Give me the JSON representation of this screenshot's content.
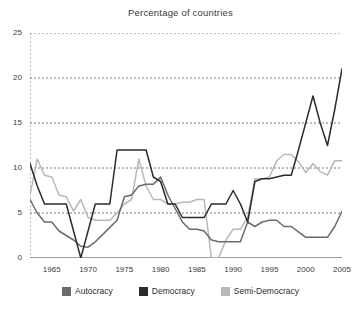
{
  "chart_data": {
    "type": "line",
    "title": "Percentage of countries",
    "xlabel": "",
    "ylabel": "",
    "xlim": [
      1962,
      2005
    ],
    "ylim": [
      0,
      25
    ],
    "grid": true,
    "grid_style": "dotted horizontal",
    "legend_position": "bottom",
    "y_ticks": [
      0,
      5,
      10,
      15,
      20,
      25
    ],
    "x_ticks": [
      1965,
      1970,
      1975,
      1980,
      1985,
      1990,
      1995,
      2000,
      2005
    ],
    "x_minor_tick_interval": 1,
    "x": [
      1962,
      1963,
      1964,
      1965,
      1966,
      1967,
      1968,
      1969,
      1970,
      1971,
      1972,
      1973,
      1974,
      1975,
      1976,
      1977,
      1978,
      1979,
      1980,
      1981,
      1982,
      1983,
      1984,
      1985,
      1986,
      1987,
      1988,
      1989,
      1990,
      1991,
      1992,
      1993,
      1994,
      1995,
      1996,
      1997,
      1998,
      1999,
      2000,
      2001,
      2002,
      2003,
      2004,
      2005
    ],
    "series": [
      {
        "name": "Autocracy",
        "color": "#6b6b6b",
        "values": [
          6.5,
          5.0,
          4.0,
          4.0,
          3.0,
          2.5,
          2.0,
          1.3,
          1.2,
          1.8,
          2.6,
          3.4,
          4.2,
          6.8,
          7.0,
          8.0,
          8.2,
          8.2,
          9.0,
          7.0,
          5.5,
          4.0,
          3.2,
          3.2,
          3.0,
          2.0,
          1.8,
          1.8,
          1.8,
          1.8,
          4.0,
          3.5,
          4.0,
          4.2,
          4.2,
          3.5,
          3.5,
          2.9,
          2.3,
          2.3,
          2.3,
          2.3,
          3.5,
          5.2
        ]
      },
      {
        "name": "Democracy",
        "color": "#2b2b2b",
        "values": [
          10.5,
          8.0,
          6.0,
          6.0,
          6.0,
          6.0,
          3.0,
          0.0,
          3.0,
          6.0,
          6.0,
          6.0,
          12.0,
          12.0,
          12.0,
          12.0,
          12.0,
          9.0,
          8.5,
          6.0,
          6.0,
          4.5,
          4.5,
          4.5,
          4.5,
          6.0,
          6.0,
          6.0,
          7.5,
          6.0,
          4.0,
          8.5,
          8.8,
          8.8,
          9.0,
          9.2,
          9.2,
          12.0,
          15.0,
          18.0,
          15.0,
          12.5,
          16.5,
          21.0
        ]
      },
      {
        "name": "Semi-Democracy",
        "color": "#b8b8b8",
        "values": [
          7.0,
          11.0,
          9.2,
          9.0,
          7.0,
          6.8,
          5.2,
          6.5,
          4.5,
          4.2,
          4.2,
          4.2,
          5.0,
          6.0,
          6.5,
          11.0,
          8.0,
          6.5,
          6.5,
          6.0,
          6.0,
          6.2,
          6.2,
          6.5,
          6.5,
          0.0,
          0.0,
          2.0,
          3.2,
          3.2,
          4.5,
          8.8,
          8.8,
          9.0,
          10.8,
          11.5,
          11.5,
          10.7,
          9.5,
          10.5,
          9.6,
          9.2,
          10.8,
          10.8
        ]
      }
    ]
  },
  "legend": {
    "items": [
      {
        "label": "Autocracy",
        "color": "#6b6b6b"
      },
      {
        "label": "Democracy",
        "color": "#2b2b2b"
      },
      {
        "label": "Semi-Democracy",
        "color": "#b8b8b8"
      }
    ]
  },
  "axis": {
    "y_labels": [
      "25",
      "20",
      "15",
      "10",
      "5",
      "0"
    ],
    "x_labels": [
      "1965",
      "1970",
      "1975",
      "1980",
      "1985",
      "1990",
      "1995",
      "2000",
      "2005"
    ]
  }
}
